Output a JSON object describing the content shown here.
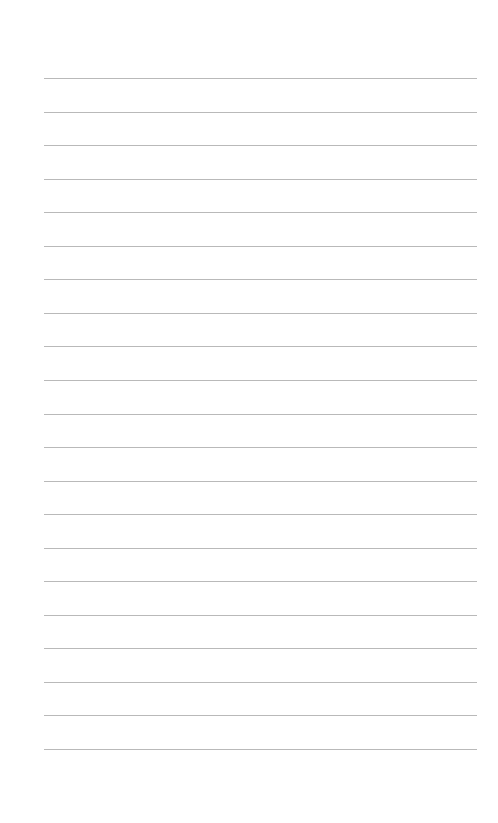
{
  "page": {
    "type": "lined-paper",
    "background_color": "#ffffff",
    "line_color": "#b9b9b9",
    "line_count": 21,
    "first_line_y": 78,
    "line_spacing": 33.55,
    "line_left": 44,
    "line_right": 477,
    "lines": [
      {
        "index": 1,
        "text": ""
      },
      {
        "index": 2,
        "text": ""
      },
      {
        "index": 3,
        "text": ""
      },
      {
        "index": 4,
        "text": ""
      },
      {
        "index": 5,
        "text": ""
      },
      {
        "index": 6,
        "text": ""
      },
      {
        "index": 7,
        "text": ""
      },
      {
        "index": 8,
        "text": ""
      },
      {
        "index": 9,
        "text": ""
      },
      {
        "index": 10,
        "text": ""
      },
      {
        "index": 11,
        "text": ""
      },
      {
        "index": 12,
        "text": ""
      },
      {
        "index": 13,
        "text": ""
      },
      {
        "index": 14,
        "text": ""
      },
      {
        "index": 15,
        "text": ""
      },
      {
        "index": 16,
        "text": ""
      },
      {
        "index": 17,
        "text": ""
      },
      {
        "index": 18,
        "text": ""
      },
      {
        "index": 19,
        "text": ""
      },
      {
        "index": 20,
        "text": ""
      },
      {
        "index": 21,
        "text": ""
      }
    ]
  }
}
